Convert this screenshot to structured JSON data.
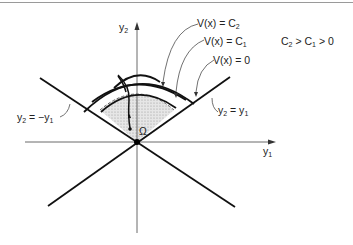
{
  "diagram": {
    "axes": {
      "y2_label": "y",
      "y2_sub": "2",
      "y1_label": "y",
      "y1_sub": "1"
    },
    "lines": {
      "neg_diag_label_main": "y",
      "neg_diag_label_sub": "2",
      "neg_diag_label_rest": " = −y",
      "neg_diag_label_sub2": "1",
      "pos_diag_label_main": "y",
      "pos_diag_label_sub": "2",
      "pos_diag_label_rest": " = y",
      "pos_diag_label_sub2": "1"
    },
    "level_sets": {
      "c2_label": "V(x) = C",
      "c2_sub": "2",
      "c1_label": "V(x) = C",
      "c1_sub": "1",
      "zero_label": "V(x) = 0"
    },
    "region_label": "Ω",
    "condition": {
      "c2": "C",
      "c2_sub": "2",
      "gt1": " > C",
      "c1_sub": "1",
      "gt2": " > 0"
    },
    "colors": {
      "line": "#111111",
      "shade": "#d8d8d8",
      "axis": "#555555"
    }
  }
}
